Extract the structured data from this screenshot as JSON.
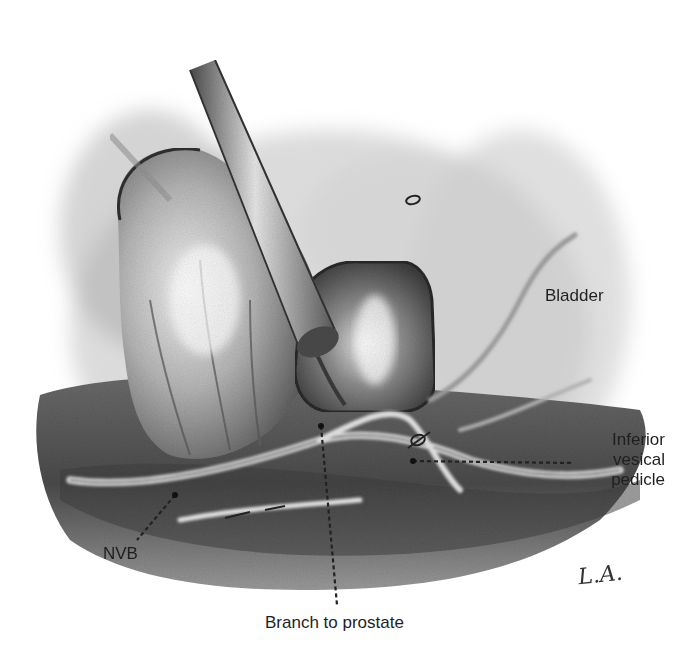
{
  "figure": {
    "type": "surgical-illustration",
    "medium": "pencil/charcoal grayscale drawing",
    "labels": {
      "bladder": "Bladder",
      "inferior_vesical_pedicle": [
        "Inferior",
        "vesical",
        "pedicle"
      ],
      "nvb": "NVB",
      "branch_to_prostate": "Branch to prostate"
    },
    "signature": "L.A.",
    "colors": {
      "background": "#ffffff",
      "label_text": "#1f1f1f",
      "leader_line": "#222222",
      "tissue_dark": "#3a3a3a",
      "tissue_mid": "#8a8a8a",
      "tissue_light": "#d8d8d8"
    }
  }
}
